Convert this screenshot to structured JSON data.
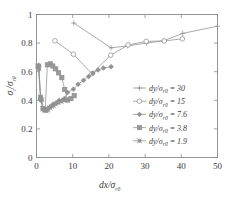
{
  "chart_data": {
    "type": "line",
    "title": "",
    "xlabel": "dx/σr0",
    "ylabel": "σr/σr0",
    "xlim": [
      0,
      50
    ],
    "ylim": [
      0,
      1
    ],
    "xticks": [
      0,
      10,
      20,
      30,
      40,
      50
    ],
    "yticks": [
      0,
      0.2,
      0.4,
      0.6,
      0.8,
      1
    ],
    "xtick_labels": [
      "0",
      "10",
      "20",
      "30",
      "40",
      "50"
    ],
    "ytick_labels": [
      "0",
      "0.2",
      "0.4",
      "0.6",
      "0.8",
      "1"
    ],
    "grid": false,
    "legend_position": "center-right",
    "series": [
      {
        "name": "dy/σr0 = 30",
        "legend_value": "30",
        "marker": "plus",
        "x": [
          10.3,
          20.6,
          25.2,
          30.4,
          35.2,
          40.4,
          50.0
        ],
        "y": [
          0.94,
          0.767,
          0.781,
          0.8,
          0.817,
          0.868,
          0.918
        ]
      },
      {
        "name": "dy/σr0 = 15",
        "legend_value": "15",
        "marker": "circle-open",
        "x": [
          5.1,
          10.2,
          15.3,
          20.5,
          25.3,
          30.3,
          35.3,
          40.3
        ],
        "y": [
          0.816,
          0.722,
          0.586,
          0.716,
          0.787,
          0.812,
          0.815,
          0.83
        ]
      },
      {
        "name": "dy/σr0 = 7.6",
        "legend_value": "7.6",
        "marker": "star-filled",
        "x": [
          0.6,
          1.2,
          1.9,
          2.5,
          3.2,
          3.9,
          4.6,
          5.4,
          6.2,
          7.0,
          7.7,
          8.6,
          10.2,
          11.5,
          13.0,
          14.4,
          15.6,
          17.0,
          18.5,
          20.6
        ],
        "y": [
          0.645,
          0.4,
          0.334,
          0.33,
          0.345,
          0.355,
          0.372,
          0.381,
          0.399,
          0.398,
          0.412,
          0.455,
          0.478,
          0.512,
          0.54,
          0.566,
          0.59,
          0.612,
          0.626,
          0.635
        ]
      },
      {
        "name": "dy/σr0 = 3.8",
        "legend_value": "3.8",
        "marker": "square",
        "x": [
          0.5,
          1.1,
          1.8,
          2.4,
          3.0,
          3.8,
          4.5,
          5.3,
          6.1,
          7.0,
          7.8,
          8.6,
          9.5,
          10.4
        ],
        "y": [
          0.638,
          0.418,
          0.343,
          0.335,
          0.648,
          0.655,
          0.64,
          0.62,
          0.592,
          0.558,
          0.475,
          0.402,
          0.412,
          0.432
        ]
      },
      {
        "name": "dy/σr0 = 1.9",
        "legend_value": "1.9",
        "marker": "star-small",
        "x": [
          0.3,
          0.7,
          1.1,
          1.5,
          1.9,
          2.3,
          2.7,
          3.1,
          3.6,
          4.1,
          4.7,
          5.3,
          6.0,
          6.8,
          7.6
        ],
        "y": [
          0.64,
          0.62,
          0.425,
          0.404,
          0.341,
          0.33,
          0.326,
          0.333,
          0.348,
          0.356,
          0.362,
          0.374,
          0.383,
          0.392,
          0.4
        ]
      }
    ]
  },
  "legend": {
    "prefix": "dy",
    "slash": "/",
    "sigma": "σ",
    "subscript": "r0",
    "equals": "=",
    "entries": [
      {
        "label": "30"
      },
      {
        "label": "15"
      },
      {
        "label": "7.6"
      },
      {
        "label": "3.8"
      },
      {
        "label": "1.9"
      }
    ]
  },
  "axes": {
    "x_title_main": "dx",
    "x_title_slash": "/",
    "x_title_sigma": "σ",
    "x_title_sub": "r0",
    "y_title_sigma1": "σ",
    "y_title_sub1": "r",
    "y_title_slash": "/",
    "y_title_sigma2": "σ",
    "y_title_sub2": "r0"
  },
  "colors": {
    "line": "#8f8f8f",
    "frame": "#8a8a8a",
    "text": "#3a3a3a",
    "background": "#ffffff"
  }
}
